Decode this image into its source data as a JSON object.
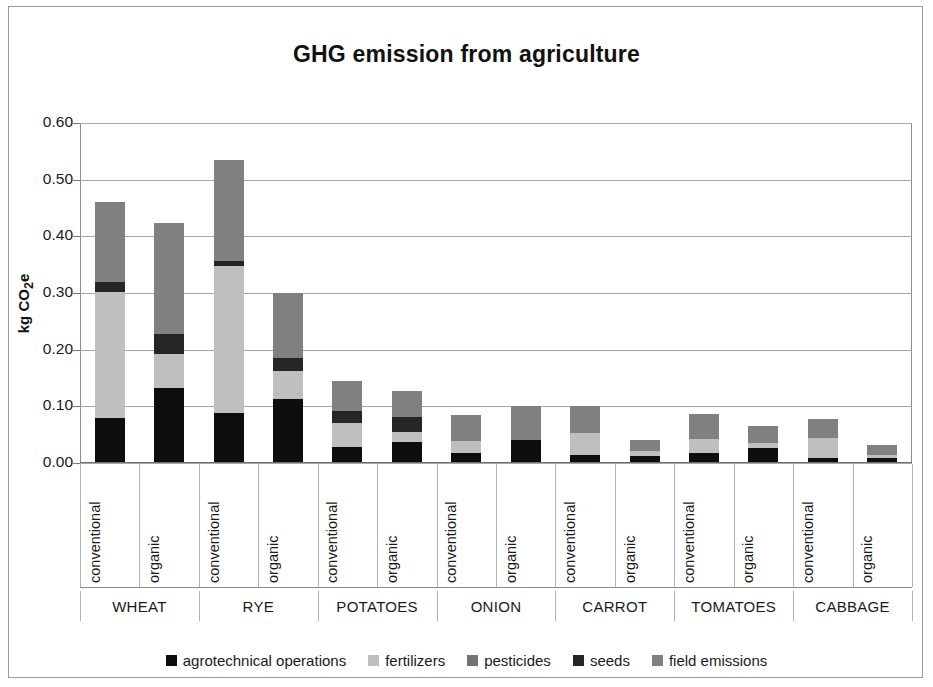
{
  "chart_data": {
    "type": "bar",
    "subtype": "stacked-column-grouped",
    "title": "GHG emission from agriculture",
    "xlabel": "",
    "ylabel": "kg CO2e",
    "ylabel_display": "kg CO₂e",
    "ylim": [
      0.0,
      0.6
    ],
    "ytick_step": 0.1,
    "ytick_labels": [
      "0.60",
      "0.50",
      "0.40",
      "0.30",
      "0.20",
      "0.10",
      "0.00"
    ],
    "ytick_values": [
      0.6,
      0.5,
      0.4,
      0.3,
      0.2,
      0.1,
      0.0
    ],
    "grid": true,
    "grid_axis": "y",
    "legend_position": "bottom",
    "categories": [
      "WHEAT",
      "RYE",
      "POTATOES",
      "ONION",
      "CARROT",
      "TOMATOES",
      "CABBAGE"
    ],
    "subcategories": [
      "conventional",
      "organic"
    ],
    "series": [
      {
        "name": "agrotechnical operations",
        "color": "#0d0d0d",
        "values": {
          "conventional": [
            0.08,
            0.089,
            0.028,
            0.018,
            0.015,
            0.017,
            0.008
          ],
          "organic": [
            0.133,
            0.113,
            0.037,
            0.041,
            0.012,
            0.026,
            0.008
          ]
        }
      },
      {
        "name": "fertilizers",
        "color": "#bfbfbf",
        "values": {
          "conventional": [
            0.222,
            0.258,
            0.043,
            0.02,
            0.038,
            0.025,
            0.036
          ],
          "organic": [
            0.06,
            0.05,
            0.017,
            0.0,
            0.01,
            0.01,
            0.006
          ]
        }
      },
      {
        "name": "pesticides",
        "color": "#737373",
        "values": {
          "conventional": [
            0.0,
            0.0,
            0.0,
            0.0,
            0.0,
            0.0,
            0.0
          ],
          "organic": [
            0.0,
            0.0,
            0.0,
            0.0,
            0.0,
            0.0,
            0.0
          ]
        }
      },
      {
        "name": "seeds",
        "color": "#262626",
        "values": {
          "conventional": [
            0.018,
            0.01,
            0.021,
            0.0,
            0.0,
            0.0,
            0.0
          ],
          "organic": [
            0.035,
            0.022,
            0.028,
            0.0,
            0.0,
            0.0,
            0.0
          ]
        }
      },
      {
        "name": "field emissions",
        "color": "#808080",
        "values": {
          "conventional": [
            0.14,
            0.178,
            0.053,
            0.047,
            0.047,
            0.045,
            0.033
          ],
          "organic": [
            0.195,
            0.115,
            0.045,
            0.059,
            0.019,
            0.03,
            0.018
          ]
        }
      }
    ],
    "totals": {
      "conventional": [
        0.46,
        0.535,
        0.145,
        0.085,
        0.1,
        0.087,
        0.077
      ],
      "organic": [
        0.423,
        0.3,
        0.127,
        0.1,
        0.041,
        0.066,
        0.032
      ]
    }
  },
  "legend": {
    "items": [
      {
        "label": "agrotechnical operations",
        "color": "#0d0d0d"
      },
      {
        "label": "fertilizers",
        "color": "#bfbfbf"
      },
      {
        "label": "pesticides",
        "color": "#737373"
      },
      {
        "label": "seeds",
        "color": "#262626"
      },
      {
        "label": "field emissions",
        "color": "#808080"
      }
    ]
  }
}
